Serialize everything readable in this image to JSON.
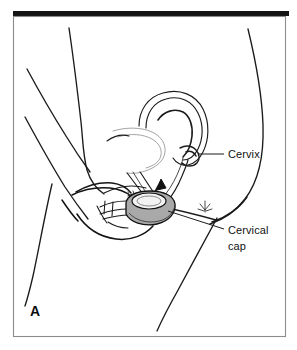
{
  "figure": {
    "panel_letter": "A",
    "caption_implied": "Cervical cap insertion",
    "background_color": "#ffffff",
    "line_color": "#1b1b1b",
    "frame_color": "#8c8c8c",
    "top_bar_color": "#141414"
  },
  "labels": [
    {
      "id": "cervix",
      "name": "cervix-label",
      "text": "Cervix",
      "x": 228,
      "y": 146,
      "leader_from_x": 198,
      "leader_from_y": 142,
      "leader_to_x": 224,
      "leader_to_y": 142
    },
    {
      "id": "cervical-cap",
      "name": "cervical-cap-label",
      "line1": "Cervical",
      "line2": "cap",
      "x": 228,
      "y": 232,
      "x2": 228,
      "y2": 248,
      "leader_from_x": 160,
      "leader_from_y": 206,
      "leader_to_x": 224,
      "leader_to_y": 228
    }
  ],
  "anatomy": {
    "parts": [
      {
        "id": "uterus",
        "name": "uterus-outline",
        "color": "#1b1b1b"
      },
      {
        "id": "uterine-cavity",
        "name": "uterine-cavity-line",
        "color": "#2a2a2a"
      },
      {
        "id": "cervix-structure",
        "name": "cervix-structure",
        "color": "#1b1b1b"
      },
      {
        "id": "vaginal-canal",
        "name": "vaginal-canal-outline",
        "color": "#1b1b1b"
      },
      {
        "id": "bladder",
        "name": "bladder-outline",
        "color": "#8d8d8d"
      },
      {
        "id": "pubic-bone",
        "name": "pubic-bone-outline",
        "color": "#1b1b1b"
      },
      {
        "id": "hand",
        "name": "hand-outline",
        "color": "#141414"
      },
      {
        "id": "fingers",
        "name": "fingers-outline",
        "color": "#1b1b1b"
      },
      {
        "id": "torso",
        "name": "torso-contour",
        "color": "#1b1b1b"
      },
      {
        "id": "buttock",
        "name": "buttock-contour",
        "color": "#1b1b1b"
      },
      {
        "id": "thigh",
        "name": "thigh-contour",
        "color": "#1b1b1b"
      },
      {
        "id": "insertion-arrow",
        "name": "insertion-arrow",
        "color": "#111111"
      }
    ]
  },
  "cap": {
    "name": "cervical-cap-device",
    "fill_color": "#a9a9a9",
    "rim_color": "#111111",
    "top_fill_color": "#f2f2f2",
    "center_x": 150,
    "center_y": 210,
    "width": 52,
    "height": 30
  },
  "frame": {
    "x": 13,
    "y": 16,
    "width": 272,
    "height": 321,
    "top_bar_x": 13,
    "top_bar_y": 11,
    "top_bar_width": 276,
    "top_bar_height": 5
  }
}
